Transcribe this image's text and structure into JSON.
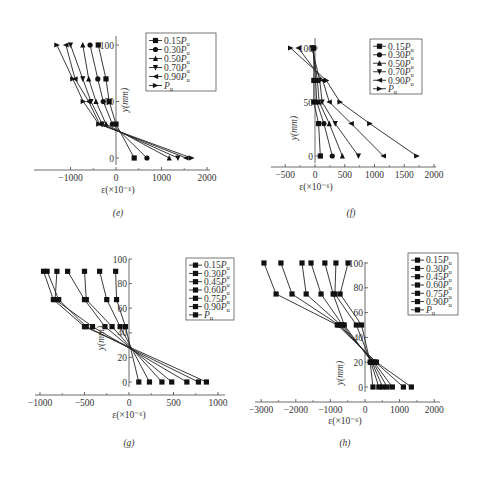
{
  "chart_data": [
    {
      "id": "e",
      "type": "line",
      "caption": "(e)",
      "xlabel": "ε(×10⁻⁶)",
      "ylabel": "y(mm)",
      "xlim": [
        -1600,
        2000
      ],
      "ylim": [
        -10,
        110
      ],
      "xticks": [
        -1000,
        0,
        1000,
        2000
      ],
      "yticks": [
        0,
        50,
        100
      ],
      "grid": false,
      "legend_position": "upper right",
      "y": [
        0,
        30,
        50,
        70,
        100
      ],
      "series": [
        {
          "name": "0.15Pu",
          "marker": "square",
          "values": [
            400,
            0,
            -150,
            -220,
            -390
          ]
        },
        {
          "name": "0.30Pu",
          "marker": "circle",
          "values": [
            680,
            -80,
            -280,
            -400,
            -570
          ]
        },
        {
          "name": "0.50Pu",
          "marker": "triangle-up",
          "values": [
            1170,
            -220,
            -440,
            -600,
            -730
          ]
        },
        {
          "name": "0.70Pu",
          "marker": "triangle-down",
          "values": [
            1360,
            -300,
            -550,
            -730,
            -1000
          ]
        },
        {
          "name": "0.90Pu",
          "marker": "triangle-left",
          "values": [
            1540,
            -360,
            -600,
            -900,
            -1100
          ]
        },
        {
          "name": "Pu",
          "marker": "triangle-right",
          "values": [
            1660,
            -380,
            -720,
            -950,
            -1300
          ]
        }
      ]
    },
    {
      "id": "f",
      "type": "line",
      "caption": "(f)",
      "xlabel": "ε(×10⁻⁶)",
      "ylabel": "y(mm)",
      "xlim": [
        -750,
        2000
      ],
      "ylim": [
        -10,
        110
      ],
      "xticks": [
        -500,
        0,
        500,
        1000,
        1500,
        2000
      ],
      "yticks": [
        0,
        50,
        100
      ],
      "grid": false,
      "legend_position": "upper right",
      "y": [
        0,
        30,
        50,
        70,
        100
      ],
      "series": [
        {
          "name": "0.15Pu",
          "marker": "square",
          "values": [
            90,
            60,
            -20,
            -20,
            -20
          ]
        },
        {
          "name": "0.30Pu",
          "marker": "circle",
          "values": [
            290,
            150,
            30,
            10,
            -30
          ]
        },
        {
          "name": "0.50Pu",
          "marker": "triangle-up",
          "values": [
            460,
            240,
            70,
            40,
            -40
          ]
        },
        {
          "name": "0.70Pu",
          "marker": "triangle-down",
          "values": [
            730,
            340,
            120,
            80,
            -50
          ]
        },
        {
          "name": "0.90Pu",
          "marker": "triangle-left",
          "values": [
            1150,
            610,
            240,
            130,
            -280
          ]
        },
        {
          "name": "Pu",
          "marker": "triangle-right",
          "values": [
            1710,
            920,
            420,
            190,
            -410
          ]
        }
      ]
    },
    {
      "id": "g",
      "type": "line",
      "caption": "(g)",
      "xlabel": "ε(×10⁻⁶)",
      "ylabel": "y(mm)",
      "xlim": [
        -1000,
        1000
      ],
      "ylim": [
        -8,
        100
      ],
      "xticks": [
        -1000,
        -500,
        0,
        500,
        1000
      ],
      "yticks": [
        0,
        20,
        40,
        60,
        80,
        100
      ],
      "grid": false,
      "legend_position": "upper right",
      "y": [
        0,
        45,
        67,
        90
      ],
      "series": [
        {
          "name": "0.15Pu",
          "marker": "square",
          "values": [
            110,
            -40,
            -140,
            -150
          ]
        },
        {
          "name": "0.30Pu",
          "marker": "square",
          "values": [
            230,
            -100,
            -250,
            -330
          ]
        },
        {
          "name": "0.45Pu",
          "marker": "square",
          "values": [
            370,
            -190,
            -480,
            -500
          ]
        },
        {
          "name": "0.60Pu",
          "marker": "square",
          "values": [
            480,
            -270,
            -500,
            -690
          ]
        },
        {
          "name": "0.75Pu",
          "marker": "square",
          "values": [
            650,
            -410,
            -830,
            -810
          ]
        },
        {
          "name": "0.90Pu",
          "marker": "square",
          "values": [
            780,
            -480,
            -790,
            -920
          ]
        },
        {
          "name": "Pu",
          "marker": "square",
          "values": [
            870,
            -500,
            -850,
            -960
          ]
        }
      ]
    },
    {
      "id": "h",
      "type": "line",
      "caption": "(h)",
      "xlabel": "ε(×10⁻⁶)",
      "ylabel": "y(mm)",
      "xlim": [
        -3000,
        2000
      ],
      "ylim": [
        -8,
        100
      ],
      "xticks": [
        -3000,
        -2000,
        -1000,
        0,
        1000,
        2000
      ],
      "yticks": [
        0,
        20,
        40,
        60,
        80,
        100
      ],
      "grid": false,
      "legend_position": "upper right",
      "y": [
        0,
        20,
        50,
        75,
        100
      ],
      "series": [
        {
          "name": "0.15Pu",
          "marker": "square",
          "values": [
            230,
            150,
            -100,
            -720,
            -490
          ]
        },
        {
          "name": "0.30Pu",
          "marker": "square",
          "values": [
            400,
            170,
            -250,
            -870,
            -840
          ]
        },
        {
          "name": "0.45Pu",
          "marker": "square",
          "values": [
            510,
            200,
            -600,
            -920,
            -1160
          ]
        },
        {
          "name": "0.60Pu",
          "marker": "square",
          "values": [
            640,
            230,
            -650,
            -1270,
            -1560
          ]
        },
        {
          "name": "0.75Pu",
          "marker": "square",
          "values": [
            790,
            260,
            -700,
            -1700,
            -1820
          ]
        },
        {
          "name": "0.90Pu",
          "marker": "square",
          "values": [
            1110,
            300,
            -750,
            -2110,
            -2430
          ]
        },
        {
          "name": "Pu",
          "marker": "square",
          "values": [
            1340,
            330,
            -800,
            -2570,
            -2920
          ]
        }
      ]
    }
  ],
  "panels": {
    "e": {
      "caption": "(e)",
      "xlabel": "ε(×10⁻⁶)",
      "ylabel": "y(mm)"
    },
    "f": {
      "caption": "(f)",
      "xlabel": "ε(×10⁻⁶)",
      "ylabel": "y(mm)"
    },
    "g": {
      "caption": "(g)",
      "xlabel": "ε(×10⁻⁶)",
      "ylabel": "y(mm)"
    },
    "h": {
      "caption": "(h)",
      "xlabel": "ε(×10⁻⁶)",
      "ylabel": "y(mm)"
    }
  }
}
